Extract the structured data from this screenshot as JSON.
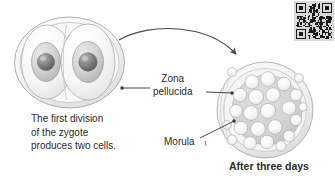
{
  "figure": {
    "background_color": "#ffffff",
    "text_color": "#2b2b2b"
  },
  "labels": {
    "zona_pellucida_line1": "Zona",
    "zona_pellucida_line2": "pellucida",
    "morula": "Morula",
    "after_three_days": "After three days"
  },
  "caption": {
    "line1": "The first division",
    "line2": "of the zygote",
    "line3": "produces two cells."
  },
  "diagram": {
    "left_structure": "two-cell-zygote",
    "right_structure": "morula",
    "arrow": "curved-arrow-left-to-right",
    "leader_lines": [
      "zona-pellucida-to-zygote",
      "zona-pellucida-to-morula",
      "morula-to-blastomere"
    ],
    "zygote_cell_count": 2,
    "morula_cell_count": 24,
    "cell_fill_color": "#f2f2f2",
    "nucleus_color": "#cfcfcf",
    "nucleolus_color": "#7d7d7d",
    "zona_color": "#e8e8e8",
    "outline_color": "#9a9a9a"
  },
  "qr_code": {
    "present": true,
    "background_color": "#d9d9d9",
    "module_color": "#1a1a1a"
  }
}
